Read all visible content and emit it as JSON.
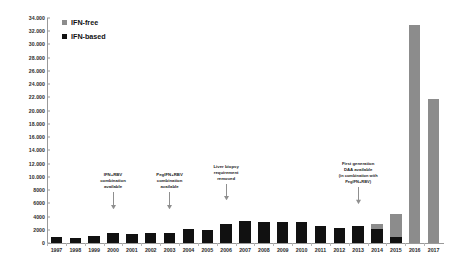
{
  "chart_data": {
    "type": "bar",
    "title": "",
    "xlabel": "",
    "ylabel": "",
    "ylim": [
      0,
      34000
    ],
    "grid": false,
    "stacked": true,
    "legend_position": "top-left",
    "categories": [
      "1997",
      "1998",
      "1999",
      "2000",
      "2001",
      "2002",
      "2003",
      "2004",
      "2005",
      "2006",
      "2007",
      "2008",
      "2009",
      "2010",
      "2011",
      "2012",
      "2013",
      "2014",
      "2015",
      "2016",
      "2017"
    ],
    "series": [
      {
        "name": "IFN-based",
        "color": "#111111",
        "values": [
          900,
          800,
          1050,
          1500,
          1400,
          1500,
          1450,
          2050,
          1900,
          2800,
          3350,
          3250,
          3250,
          3250,
          2500,
          2250,
          2600,
          2100,
          950,
          0,
          0
        ]
      },
      {
        "name": "IFN-free",
        "color": "#8c8c8c",
        "values": [
          0,
          0,
          0,
          0,
          0,
          0,
          0,
          0,
          0,
          0,
          0,
          0,
          0,
          0,
          0,
          0,
          0,
          800,
          3450,
          33000,
          21700
        ]
      }
    ],
    "totals": [
      900,
      800,
      1050,
      1500,
      1400,
      1500,
      1450,
      2050,
      1900,
      2800,
      3350,
      3250,
      3250,
      3250,
      2500,
      2250,
      2600,
      2900,
      4400,
      33000,
      21700
    ],
    "yticks": [
      "34.000",
      "32.000",
      "30.000",
      "28.000",
      "26.000",
      "24.000",
      "22.000",
      "20.000",
      "18.000",
      "16.000",
      "14.000",
      "12.000",
      "10.000",
      "8000",
      "6000",
      "4000",
      "2000",
      "0"
    ],
    "ytick_values": [
      34000,
      32000,
      30000,
      28000,
      26000,
      24000,
      22000,
      20000,
      18000,
      16000,
      14000,
      12000,
      10000,
      8000,
      6000,
      4000,
      2000,
      0
    ],
    "legend": [
      {
        "label": "IFN-free",
        "color": "#8c8c8c"
      },
      {
        "label": "IFN-based",
        "color": "#111111"
      }
    ],
    "annotations": [
      {
        "id": "ifn-rbv",
        "lines": [
          "IFN+RBV",
          "combination",
          "available"
        ],
        "sub_from": 99,
        "target_category": "2000"
      },
      {
        "id": "pegifn-rbv",
        "lines": [
          "PegIFN+RBV",
          "combination",
          "available"
        ],
        "sub_from": 99,
        "target_category": "2003"
      },
      {
        "id": "liver-biopsy",
        "lines": [
          "Liver biopsy",
          "requirement",
          "removed"
        ],
        "sub_from": 99,
        "target_category": "2006"
      },
      {
        "id": "first-gen-daa",
        "lines": [
          "First generation",
          "DAA available",
          "(in combination with",
          "PegIFN+RBV)"
        ],
        "sub_from": 2,
        "target_category": "2013"
      }
    ]
  }
}
